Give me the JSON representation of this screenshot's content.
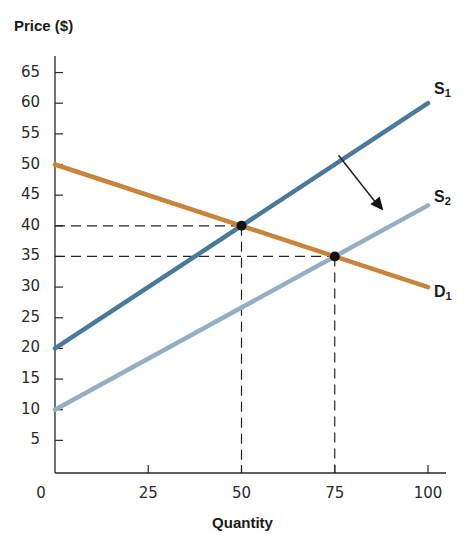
{
  "chart_data": {
    "type": "line",
    "title": "",
    "xlabel": "Quantity",
    "ylabel": "Price ($)",
    "xlim": [
      0,
      100
    ],
    "ylim": [
      0,
      65
    ],
    "grid": false,
    "x_ticks": [
      0,
      25,
      50,
      75,
      100
    ],
    "y_ticks": [
      5,
      10,
      15,
      20,
      25,
      30,
      35,
      40,
      45,
      50,
      55,
      60,
      65
    ],
    "series": [
      {
        "name": "S1",
        "label_main": "S",
        "label_sub": "1",
        "color": "#4A7A99",
        "points": [
          [
            0,
            20
          ],
          [
            100,
            60
          ]
        ]
      },
      {
        "name": "S2",
        "label_main": "S",
        "label_sub": "2",
        "color": "#94AEC4",
        "points": [
          [
            0,
            10
          ],
          [
            100,
            43.33
          ]
        ]
      },
      {
        "name": "D1",
        "label_main": "D",
        "label_sub": "1",
        "color": "#C8843A",
        "points": [
          [
            0,
            50
          ],
          [
            100,
            30
          ]
        ]
      }
    ],
    "equilibria": [
      {
        "name": "E1",
        "x": 50,
        "y": 40
      },
      {
        "name": "E2",
        "x": 75,
        "y": 35
      }
    ],
    "annotations": [
      {
        "type": "arrow",
        "description": "Supply shift rightward from S1 to S2",
        "from": [
          76,
          51.5
        ],
        "to": [
          88,
          42.5
        ]
      },
      {
        "type": "dashed-guides",
        "points": [
          [
            50,
            40
          ],
          [
            75,
            35
          ]
        ]
      }
    ],
    "legend": "inline-labels-right"
  }
}
